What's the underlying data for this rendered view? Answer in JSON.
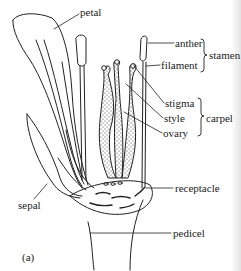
{
  "figure": {
    "panel_label": "(a)",
    "labels": {
      "petal": "petal",
      "anther": "anther",
      "filament": "filament",
      "stamen": "stamen",
      "stigma": "stigma",
      "style": "style",
      "ovary": "ovary",
      "carpel": "carpel",
      "sepal": "sepal",
      "receptacle": "receptacle",
      "pedicel": "pedicel"
    },
    "groups": [
      {
        "name": "stamen",
        "members": [
          "anther",
          "filament"
        ]
      },
      {
        "name": "carpel",
        "members": [
          "stigma",
          "style",
          "ovary"
        ]
      }
    ],
    "colors": {
      "ink": "#222222",
      "paper": "#ffffff"
    }
  }
}
